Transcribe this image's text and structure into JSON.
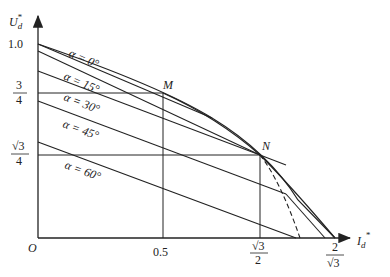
{
  "diagram": {
    "y_axis": {
      "label": "U",
      "sub": "d",
      "sup": "*"
    },
    "x_axis": {
      "label": "I",
      "sub": "d",
      "sup": "*"
    },
    "origin": "O",
    "y_ticks": [
      {
        "label": "1.0"
      },
      {
        "num": "3",
        "den": "4"
      },
      {
        "num": "√3",
        "den": "4"
      }
    ],
    "x_ticks": [
      {
        "label": "0.5"
      },
      {
        "num": "√3",
        "den": "2"
      },
      {
        "num": "2",
        "den": "√3"
      }
    ],
    "points": {
      "M": "M",
      "N": "N"
    },
    "lines": [
      {
        "label": "α = 0°"
      },
      {
        "label": "α = 15°"
      },
      {
        "label": "α = 30°"
      },
      {
        "label": "α = 45°"
      },
      {
        "label": "α = 60°"
      }
    ]
  }
}
